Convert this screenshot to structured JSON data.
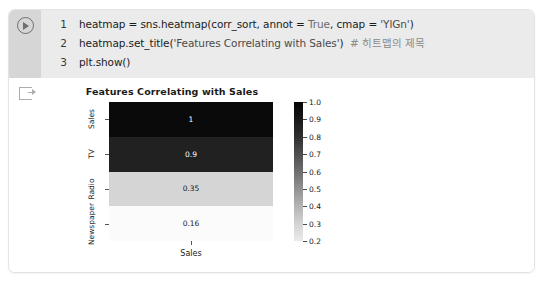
{
  "cell": {
    "run_button_icon": "play-icon",
    "output_icon": "output-arrow-icon",
    "lines": [
      {
        "number": "1",
        "segments": [
          {
            "text": "heatmap = sns.heatmap(corr_sort, annot = ",
            "cls": "tok-plain"
          },
          {
            "text": "True",
            "cls": "tok-kw"
          },
          {
            "text": ", cmap = ",
            "cls": "tok-plain"
          },
          {
            "text": "'YlGn'",
            "cls": "tok-str"
          },
          {
            "text": ")",
            "cls": "tok-plain"
          }
        ]
      },
      {
        "number": "2",
        "segments": [
          {
            "text": "heatmap.set_title(",
            "cls": "tok-plain"
          },
          {
            "text": "'Features Correlating with Sales'",
            "cls": "tok-str"
          },
          {
            "text": ")  ",
            "cls": "tok-plain"
          },
          {
            "text": "# 히트맵의 제목",
            "cls": "tok-cmt"
          }
        ]
      },
      {
        "number": "3",
        "segments": [
          {
            "text": "plt.show()",
            "cls": "tok-plain"
          }
        ]
      }
    ]
  },
  "chart_data": {
    "type": "heatmap",
    "title": "Features Correlating with Sales",
    "xlabel": "",
    "ylabel": "",
    "xticklabels": [
      "Sales"
    ],
    "yticklabels": [
      "Sales",
      "TV",
      "Radio",
      "Newspaper"
    ],
    "annotations": [
      "1",
      "0.9",
      "0.35",
      "0.16"
    ],
    "values": [
      1.0,
      0.9,
      0.35,
      0.16
    ],
    "cell_colors": [
      "#0a0a0a",
      "#212121",
      "#d5d5d5",
      "#fbfbfb"
    ],
    "text_colors": [
      "#ffffff",
      "#ffffff",
      "#1a1a1a",
      "#1a1a1a"
    ],
    "colormap": "YlGn",
    "colorbar": {
      "ticks": [
        "1.0",
        "0.9",
        "0.8",
        "0.7",
        "0.6",
        "0.5",
        "0.4",
        "0.3",
        "0.2"
      ],
      "vmin": 0.16,
      "vmax": 1.0,
      "position": "right"
    },
    "grid": false,
    "legend": false
  }
}
